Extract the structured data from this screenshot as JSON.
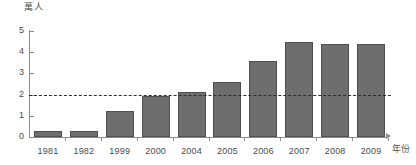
{
  "chart_data": {
    "type": "bar",
    "title": "",
    "subtitle": "",
    "ylabel": "萬人",
    "xlabel": "年份",
    "categories": [
      "1981",
      "1982",
      "1999",
      "2000",
      "2004",
      "2005",
      "2006",
      "2007",
      "2008",
      "2009"
    ],
    "values": [
      0.3,
      0.3,
      1.25,
      1.95,
      2.1,
      2.6,
      3.6,
      4.5,
      4.4,
      4.4
    ],
    "ylim": [
      0,
      5
    ],
    "ytick_labels": [
      "0",
      "1",
      "2",
      "3",
      "4",
      "5"
    ],
    "ytick_values": [
      0,
      1,
      2,
      3,
      4,
      5
    ],
    "grid": false,
    "legend": "none",
    "annotations": [
      {
        "name": "reference-line",
        "kind": "horizontal-dashed-line",
        "value": 2
      }
    ],
    "bar_color": "#6e6e6e",
    "bar_border_color": "#4f4f4f",
    "axis_color": "#8c8c8c",
    "reference_line_color": "#2e2e2e"
  }
}
